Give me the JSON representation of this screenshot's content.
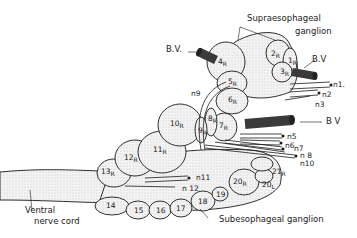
{
  "figure": {
    "labels": {
      "supraesophageal_line1": "Supraesophageal",
      "supraesophageal_line2": "ganglion",
      "subesophageal": "Subesophageal  ganglion",
      "ventral_line1": "Ventral",
      "ventral_line2": "nerve cord",
      "bv_left": "B.V.",
      "bv_upper_right": "B.V",
      "bv_mid_right": "B V"
    },
    "nerves": {
      "n1": "n1.",
      "n2": "n2",
      "n3": "n3",
      "n5": "n5",
      "n6": "n6",
      "n7": "n7",
      "n8": "n 8",
      "n9": "n9",
      "n10": "n10",
      "n11": "n11",
      "n12": "n 12"
    },
    "lobes": {
      "l1": {
        "n": "1",
        "s": "R"
      },
      "l2": {
        "n": "2",
        "s": "R"
      },
      "l3": {
        "n": "3",
        "s": "R"
      },
      "l4": {
        "n": "4",
        "s": "R"
      },
      "l5": {
        "n": "5",
        "s": "R"
      },
      "l6": {
        "n": "6",
        "s": "R"
      },
      "l7": {
        "n": "7",
        "s": "R"
      },
      "l8": {
        "n": "8",
        "s": "R"
      },
      "l9": {
        "n": "9",
        "s": "R"
      },
      "l10": {
        "n": "10",
        "s": "R"
      },
      "l11": {
        "n": "11",
        "s": "R"
      },
      "l12": {
        "n": "12",
        "s": "R"
      },
      "l13": {
        "n": "13",
        "s": "R"
      },
      "l14": {
        "n": "14",
        "s": ""
      },
      "l15": {
        "n": "15",
        "s": ""
      },
      "l16": {
        "n": "16",
        "s": ""
      },
      "l17": {
        "n": "17",
        "s": ""
      },
      "l18": {
        "n": "18",
        "s": ""
      },
      "l19": {
        "n": "19",
        "s": ""
      },
      "l20r": {
        "n": "20",
        "s": "R"
      },
      "l20l": {
        "n": "20",
        "s": "L"
      },
      "l21": {
        "n": "21",
        "s": "R"
      }
    },
    "colors": {
      "ink": "#1a1a1a",
      "stipple": "#d9d9d9",
      "background": "#ffffff"
    }
  }
}
